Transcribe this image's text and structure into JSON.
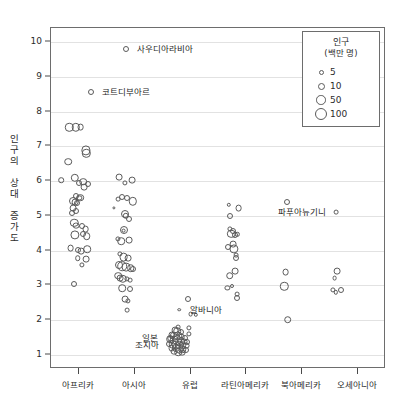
{
  "chart_data": {
    "type": "scatter",
    "title": "",
    "xlabel": "",
    "ylabel": "인구의 상대 증가도",
    "ylim": [
      0.6,
      10.4
    ],
    "grid": true,
    "legend_position": "top-right",
    "ytick_labels": [
      "10",
      "9",
      "8",
      "7",
      "6",
      "5",
      "4",
      "3",
      "2",
      "1"
    ],
    "ytick_values": [
      10,
      9,
      8,
      7,
      6,
      5,
      4,
      3,
      2,
      1
    ],
    "categories": [
      "아프리카",
      "아시아",
      "유럽",
      "라틴아메리카",
      "북아메리카",
      "오세아니아"
    ],
    "size_legend": {
      "title": "인구",
      "subtitle": "(백만 명)",
      "entries": [
        {
          "label": "5",
          "px": 5
        },
        {
          "label": "10",
          "px": 7
        },
        {
          "label": "50",
          "px": 9.5
        },
        {
          "label": "100",
          "px": 12
        }
      ]
    },
    "annotations": [
      {
        "label": "사우디아라비아",
        "category": "아시아",
        "value": 9.8,
        "align": "left"
      },
      {
        "label": "코트디부아르",
        "category": "아프리카",
        "value": 8.55,
        "align": "left"
      },
      {
        "label": "파푸아뉴기니",
        "category": "오세아니아",
        "value": 5.1,
        "align": "right"
      },
      {
        "label": "알바니아",
        "category": "유럽",
        "value": 2.3,
        "align": "left"
      },
      {
        "label": "일본",
        "category": "유럽",
        "value": 1.5,
        "align": "right"
      },
      {
        "label": "조지아",
        "category": "유럽",
        "value": 1.28,
        "align": "right"
      }
    ],
    "series": [
      {
        "name": "아프리카",
        "points": [
          {
            "x": 0.83,
            "y": 7.55,
            "r": 4.2
          },
          {
            "x": 0.94,
            "y": 7.55,
            "r": 4.2
          },
          {
            "x": 1.03,
            "y": 7.55,
            "r": 3.4
          },
          {
            "x": 1.13,
            "y": 6.88,
            "r": 4.6
          },
          {
            "x": 1.13,
            "y": 6.8,
            "r": 4.2
          },
          {
            "x": 0.81,
            "y": 6.56,
            "r": 3.8
          },
          {
            "x": 1.21,
            "y": 8.55,
            "r": 3.0
          },
          {
            "x": 0.68,
            "y": 6.02,
            "r": 2.8
          },
          {
            "x": 0.93,
            "y": 6.1,
            "r": 4.2
          },
          {
            "x": 1.0,
            "y": 5.95,
            "r": 3.0
          },
          {
            "x": 1.08,
            "y": 5.98,
            "r": 3.8
          },
          {
            "x": 1.16,
            "y": 5.92,
            "r": 3.0
          },
          {
            "x": 1.09,
            "y": 5.82,
            "r": 3.4
          },
          {
            "x": 0.94,
            "y": 5.58,
            "r": 3.0
          },
          {
            "x": 1.01,
            "y": 5.52,
            "r": 2.6
          },
          {
            "x": 0.9,
            "y": 5.42,
            "r": 4.0
          },
          {
            "x": 0.93,
            "y": 5.4,
            "r": 3.4
          },
          {
            "x": 0.96,
            "y": 5.36,
            "r": 3.0
          },
          {
            "x": 0.9,
            "y": 5.22,
            "r": 3.4
          },
          {
            "x": 0.95,
            "y": 5.15,
            "r": 3.0
          },
          {
            "x": 0.88,
            "y": 5.08,
            "r": 3.0
          },
          {
            "x": 1.02,
            "y": 5.52,
            "r": 3.8
          },
          {
            "x": 0.92,
            "y": 4.8,
            "r": 4.2
          },
          {
            "x": 0.95,
            "y": 4.72,
            "r": 3.4
          },
          {
            "x": 1.05,
            "y": 4.72,
            "r": 3.0
          },
          {
            "x": 1.12,
            "y": 4.62,
            "r": 3.4
          },
          {
            "x": 0.93,
            "y": 4.45,
            "r": 4.6
          },
          {
            "x": 1.08,
            "y": 4.48,
            "r": 3.0
          },
          {
            "x": 1.14,
            "y": 4.42,
            "r": 3.8
          },
          {
            "x": 0.85,
            "y": 4.08,
            "r": 3.4
          },
          {
            "x": 0.99,
            "y": 4.02,
            "r": 3.0
          },
          {
            "x": 1.04,
            "y": 3.98,
            "r": 3.4
          },
          {
            "x": 1.15,
            "y": 4.05,
            "r": 3.8
          },
          {
            "x": 0.98,
            "y": 3.78,
            "r": 2.8
          },
          {
            "x": 1.13,
            "y": 3.75,
            "r": 3.4
          },
          {
            "x": 1.05,
            "y": 3.58,
            "r": 2.6
          },
          {
            "x": 0.92,
            "y": 3.05,
            "r": 3.0
          }
        ]
      },
      {
        "name": "아시아",
        "points": [
          {
            "x": 1.85,
            "y": 9.8,
            "r": 3.0
          },
          {
            "x": 1.72,
            "y": 6.12,
            "r": 3.4
          },
          {
            "x": 1.83,
            "y": 5.95,
            "r": 2.6
          },
          {
            "x": 1.95,
            "y": 6.02,
            "r": 3.4
          },
          {
            "x": 1.7,
            "y": 5.48,
            "r": 2.4
          },
          {
            "x": 1.78,
            "y": 5.55,
            "r": 3.0
          },
          {
            "x": 1.86,
            "y": 5.52,
            "r": 3.0
          },
          {
            "x": 1.97,
            "y": 5.42,
            "r": 4.2
          },
          {
            "x": 1.62,
            "y": 5.22,
            "r": 1.6
          },
          {
            "x": 1.82,
            "y": 5.05,
            "r": 4.0
          },
          {
            "x": 1.84,
            "y": 5.0,
            "r": 3.2
          },
          {
            "x": 1.9,
            "y": 4.92,
            "r": 3.0
          },
          {
            "x": 1.8,
            "y": 4.6,
            "r": 4.0
          },
          {
            "x": 1.8,
            "y": 4.58,
            "r": 2.4
          },
          {
            "x": 1.7,
            "y": 4.35,
            "r": 2.6
          },
          {
            "x": 1.76,
            "y": 4.28,
            "r": 3.8
          },
          {
            "x": 1.9,
            "y": 4.3,
            "r": 3.4
          },
          {
            "x": 1.74,
            "y": 3.9,
            "r": 2.6
          },
          {
            "x": 1.8,
            "y": 3.82,
            "r": 4.4
          },
          {
            "x": 1.88,
            "y": 3.78,
            "r": 3.4
          },
          {
            "x": 1.72,
            "y": 3.6,
            "r": 4.0
          },
          {
            "x": 1.78,
            "y": 3.55,
            "r": 4.8
          },
          {
            "x": 1.85,
            "y": 3.52,
            "r": 4.4
          },
          {
            "x": 1.93,
            "y": 3.5,
            "r": 3.8
          },
          {
            "x": 1.97,
            "y": 3.48,
            "r": 3.0
          },
          {
            "x": 1.7,
            "y": 3.28,
            "r": 3.8
          },
          {
            "x": 1.74,
            "y": 3.22,
            "r": 3.4
          },
          {
            "x": 1.79,
            "y": 3.2,
            "r": 4.2
          },
          {
            "x": 1.86,
            "y": 3.18,
            "r": 2.6
          },
          {
            "x": 1.92,
            "y": 3.15,
            "r": 2.4
          },
          {
            "x": 1.78,
            "y": 2.92,
            "r": 3.8
          },
          {
            "x": 1.92,
            "y": 2.9,
            "r": 3.0
          },
          {
            "x": 1.83,
            "y": 2.6,
            "r": 3.4
          },
          {
            "x": 1.88,
            "y": 2.55,
            "r": 2.6
          },
          {
            "x": 1.86,
            "y": 2.3,
            "r": 2.4
          }
        ]
      },
      {
        "name": "유럽",
        "points": [
          {
            "x": 2.95,
            "y": 2.62,
            "r": 3.0
          },
          {
            "x": 2.8,
            "y": 2.3,
            "r": 1.8
          },
          {
            "x": 3.0,
            "y": 2.18,
            "r": 2.4
          },
          {
            "x": 3.09,
            "y": 2.15,
            "r": 2.2
          },
          {
            "x": 2.78,
            "y": 1.8,
            "r": 2.4
          },
          {
            "x": 2.97,
            "y": 1.78,
            "r": 2.6
          },
          {
            "x": 2.72,
            "y": 1.72,
            "r": 3.4
          },
          {
            "x": 2.76,
            "y": 1.68,
            "r": 3.8
          },
          {
            "x": 2.82,
            "y": 1.66,
            "r": 3.0
          },
          {
            "x": 2.66,
            "y": 1.58,
            "r": 3.4
          },
          {
            "x": 2.71,
            "y": 1.56,
            "r": 4.2
          },
          {
            "x": 2.77,
            "y": 1.54,
            "r": 4.6
          },
          {
            "x": 2.84,
            "y": 1.52,
            "r": 3.4
          },
          {
            "x": 2.9,
            "y": 1.5,
            "r": 3.0
          },
          {
            "x": 2.64,
            "y": 1.45,
            "r": 3.8
          },
          {
            "x": 2.7,
            "y": 1.43,
            "r": 4.4
          },
          {
            "x": 2.76,
            "y": 1.42,
            "r": 5.0
          },
          {
            "x": 2.82,
            "y": 1.4,
            "r": 4.0
          },
          {
            "x": 2.88,
            "y": 1.39,
            "r": 3.4
          },
          {
            "x": 2.94,
            "y": 1.38,
            "r": 3.0
          },
          {
            "x": 2.62,
            "y": 1.33,
            "r": 3.0
          },
          {
            "x": 2.68,
            "y": 1.31,
            "r": 4.2
          },
          {
            "x": 2.74,
            "y": 1.3,
            "r": 4.6
          },
          {
            "x": 2.8,
            "y": 1.29,
            "r": 4.2
          },
          {
            "x": 2.86,
            "y": 1.28,
            "r": 3.8
          },
          {
            "x": 2.92,
            "y": 1.27,
            "r": 3.4
          },
          {
            "x": 2.66,
            "y": 1.2,
            "r": 3.4
          },
          {
            "x": 2.73,
            "y": 1.19,
            "r": 4.0
          },
          {
            "x": 2.79,
            "y": 1.18,
            "r": 4.4
          },
          {
            "x": 2.86,
            "y": 1.17,
            "r": 3.8
          },
          {
            "x": 2.92,
            "y": 1.16,
            "r": 3.0
          },
          {
            "x": 2.7,
            "y": 1.1,
            "r": 3.4
          },
          {
            "x": 2.78,
            "y": 1.08,
            "r": 3.8
          },
          {
            "x": 2.85,
            "y": 1.07,
            "r": 3.4
          },
          {
            "x": 2.64,
            "y": 1.48,
            "r": 2.6
          },
          {
            "x": 2.97,
            "y": 1.6,
            "r": 2.6
          }
        ]
      },
      {
        "name": "라틴아메리카",
        "points": [
          {
            "x": 3.68,
            "y": 5.32,
            "r": 2.2
          },
          {
            "x": 3.86,
            "y": 5.22,
            "r": 3.4
          },
          {
            "x": 3.7,
            "y": 5.0,
            "r": 3.0
          },
          {
            "x": 3.7,
            "y": 4.62,
            "r": 2.6
          },
          {
            "x": 3.76,
            "y": 4.58,
            "r": 3.0
          },
          {
            "x": 3.73,
            "y": 4.48,
            "r": 4.2
          },
          {
            "x": 3.79,
            "y": 4.45,
            "r": 3.0
          },
          {
            "x": 3.84,
            "y": 4.47,
            "r": 2.2
          },
          {
            "x": 3.67,
            "y": 4.12,
            "r": 3.0
          },
          {
            "x": 3.76,
            "y": 4.18,
            "r": 3.4
          },
          {
            "x": 3.77,
            "y": 4.05,
            "r": 4.6
          },
          {
            "x": 3.82,
            "y": 3.88,
            "r": 2.4
          },
          {
            "x": 3.82,
            "y": 3.8,
            "r": 3.0
          },
          {
            "x": 3.8,
            "y": 3.42,
            "r": 3.4
          },
          {
            "x": 3.7,
            "y": 3.28,
            "r": 3.8
          },
          {
            "x": 3.66,
            "y": 2.92,
            "r": 2.6
          },
          {
            "x": 3.75,
            "y": 2.98,
            "r": 2.0
          },
          {
            "x": 3.83,
            "y": 2.75,
            "r": 2.4
          },
          {
            "x": 3.84,
            "y": 2.65,
            "r": 3.0
          }
        ]
      },
      {
        "name": "북아메리카",
        "points": [
          {
            "x": 4.72,
            "y": 5.4,
            "r": 3.0
          },
          {
            "x": 4.7,
            "y": 3.38,
            "r": 3.4
          },
          {
            "x": 4.68,
            "y": 2.98,
            "r": 4.2
          },
          {
            "x": 4.74,
            "y": 2.02,
            "r": 3.8
          }
        ]
      },
      {
        "name": "오세아니아",
        "points": [
          {
            "x": 5.6,
            "y": 5.1,
            "r": 2.4
          },
          {
            "x": 5.62,
            "y": 3.42,
            "r": 3.4
          },
          {
            "x": 5.58,
            "y": 3.22,
            "r": 2.4
          },
          {
            "x": 5.55,
            "y": 2.88,
            "r": 2.6
          },
          {
            "x": 5.6,
            "y": 2.8,
            "r": 2.2
          },
          {
            "x": 5.7,
            "y": 2.88,
            "r": 3.0
          }
        ]
      }
    ]
  }
}
